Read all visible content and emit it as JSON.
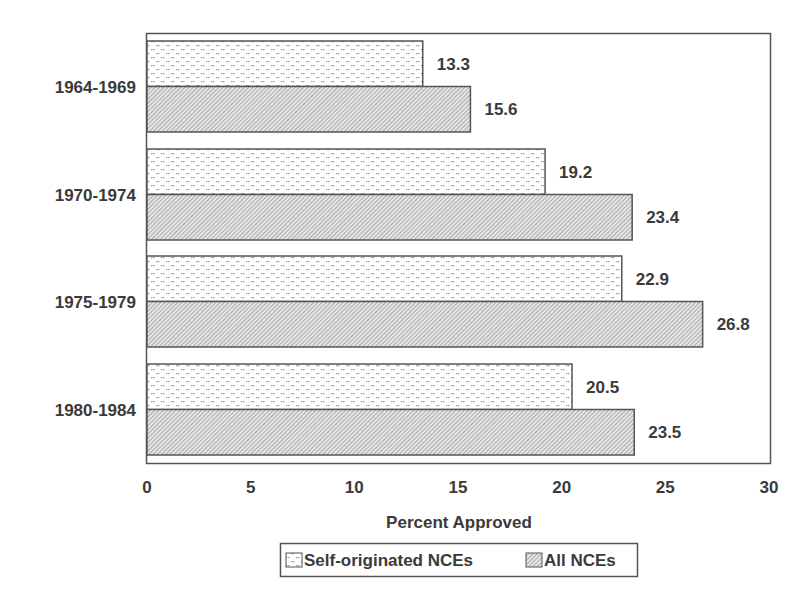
{
  "chart_data": {
    "type": "bar",
    "orientation": "horizontal",
    "title": "",
    "xlabel": "Percent Approved",
    "ylabel": "",
    "xlim": [
      0,
      30
    ],
    "x_ticks": [
      0,
      5,
      10,
      15,
      20,
      25,
      30
    ],
    "grid": false,
    "legend_position": "bottom",
    "categories": [
      "1964-1969",
      "1970-1974",
      "1975-1979",
      "1980-1984"
    ],
    "series": [
      {
        "name": "Self-originated NCEs",
        "pattern": "dotted",
        "values": [
          13.3,
          19.2,
          22.9,
          20.5
        ]
      },
      {
        "name": "All NCEs",
        "pattern": "diagonal-hatch",
        "values": [
          15.6,
          23.4,
          26.8,
          23.5
        ]
      }
    ],
    "value_labels": {
      "Self-originated NCEs": [
        "13.3",
        "19.2",
        "22.9",
        "20.5"
      ],
      "All NCEs": [
        "15.6",
        "23.4",
        "26.8",
        "23.5"
      ]
    }
  },
  "colors": {
    "frame": "#555555",
    "bar_outline": "#555555",
    "dot": "#9a9a9a",
    "hatch": "#8a8a8a",
    "text": "#3a3a3a"
  },
  "legend": {
    "items": [
      {
        "label": "Self-originated NCEs"
      },
      {
        "label": "All NCEs"
      }
    ]
  }
}
